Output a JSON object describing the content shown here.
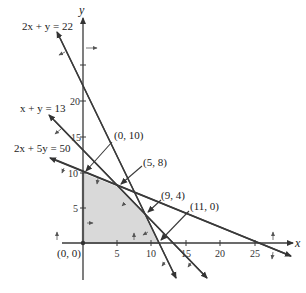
{
  "diagram": {
    "type": "linear-programming-feasible-region",
    "axes": {
      "x_label": "x",
      "y_label": "y",
      "x_ticks": [
        "5",
        "10",
        "15",
        "20",
        "25"
      ],
      "y_ticks": [
        "5",
        "10",
        "15",
        "20"
      ]
    },
    "constraints": [
      {
        "id": "c1",
        "label": "2x + y = 22"
      },
      {
        "id": "c2",
        "label": "x + y = 13"
      },
      {
        "id": "c3",
        "label": "2x + 5y = 50"
      }
    ],
    "vertices": [
      {
        "label": "(0, 0)"
      },
      {
        "label": "(0, 10)"
      },
      {
        "label": "(5, 8)"
      },
      {
        "label": "(9, 4)"
      },
      {
        "label": "(11, 0)"
      }
    ],
    "colors": {
      "line": "#3a3a3a",
      "region": "#d9d9d9",
      "axis": "#3a3a3a"
    }
  }
}
